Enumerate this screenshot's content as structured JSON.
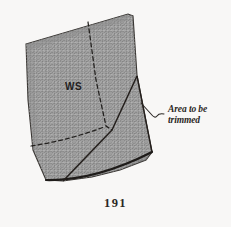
{
  "figure": {
    "caption_number": "191",
    "piece_label": "WS",
    "annotation": {
      "line1": "Area to be",
      "line2": "trimmed"
    },
    "colors": {
      "background": "#f8f7f6",
      "fabric_fill": "#9a9a9a",
      "outline": "#24211f",
      "text": "#2b2724"
    },
    "icons": {
      "leader_line": "leader-hook-icon"
    }
  }
}
